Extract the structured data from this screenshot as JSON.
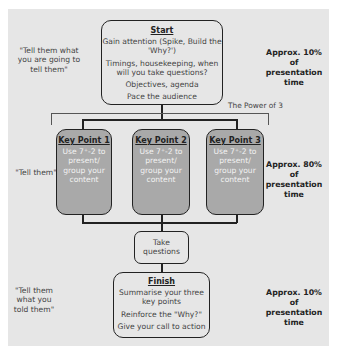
{
  "start": {
    "title": "Start",
    "lines": [
      "Gain attention (Spike, Build the 'Why?')",
      "Timings, housekeeping, when will you take questions?",
      "Objectives, agenda",
      "Pace the audience"
    ]
  },
  "key_points": [
    {
      "title": "Key Point 1",
      "body": "Use 7⁺-2 to present/ group your content"
    },
    {
      "title": "Key Point 2",
      "body": "Use 7⁺-2 to present/ group your content"
    },
    {
      "title": "Key Point 3",
      "body": "Use 7⁺-2 to present/ group your content"
    }
  ],
  "questions": {
    "label": "Take questions"
  },
  "finish": {
    "title": "Finish",
    "lines": [
      "Summarise your three key points",
      "Reinforce the \"Why?\"",
      "Give your call to action"
    ]
  },
  "bracket_label": "The Power of 3",
  "left_labels": {
    "top": "\"Tell them what you are going to tell them\"",
    "middle": "\"Tell them\"",
    "bottom": "\"Tell them what you told them\""
  },
  "right_labels": {
    "top": "Approx. 10% of presentation time",
    "middle": "Approx. 80% of presentation time",
    "bottom": "Approx. 10% of presentation time"
  },
  "colors": {
    "panel": "#e6e6e6",
    "key_point_fill": "#a9a9a9",
    "outline": "#222222"
  }
}
